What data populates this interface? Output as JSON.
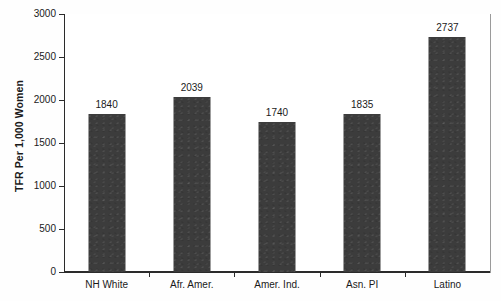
{
  "chart_data": {
    "type": "bar",
    "title": "",
    "subtitle": "",
    "xlabel": "",
    "ylabel": "TFR Per 1,000 Women",
    "categories": [
      "NH White",
      "Afr. Amer.",
      "Amer. Ind.",
      "Asn. PI",
      "Latino"
    ],
    "values": [
      1840,
      2039,
      1740,
      1835,
      2737
    ],
    "value_labels": [
      "1840",
      "2039",
      "1740",
      "1835",
      "2737"
    ],
    "ylim": [
      0,
      3000
    ],
    "ytick_values": [
      0,
      500,
      1000,
      1500,
      2000,
      2500,
      3000
    ],
    "ytick_labels": [
      "0",
      "500",
      "1000",
      "1500",
      "2000",
      "2500",
      "3000"
    ],
    "grid": true,
    "legend": false,
    "legend_position": "none",
    "bar_color": "#3c3c3c",
    "gridline_color": "#a8a8a8",
    "axis_color": "#2b2b2b",
    "background_color": "#ffffff"
  }
}
